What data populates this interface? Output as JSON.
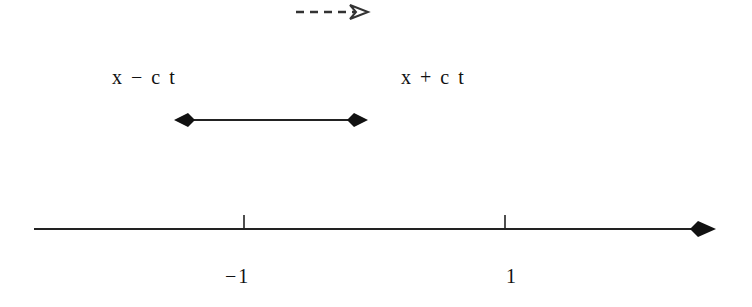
{
  "diagram": {
    "type": "number-line",
    "labels": {
      "left_endpoint": "x − c t",
      "right_endpoint": "x + c t",
      "tick_minus_one": "−1",
      "tick_one": "1"
    },
    "colors": {
      "line": "#1a1a1a",
      "background": "#ffffff"
    },
    "elements": {
      "direction_arrow": {
        "style": "dashed",
        "head": "open",
        "direction": "right"
      },
      "interval_arrow": {
        "style": "solid",
        "heads": "both",
        "head_shape": "filled-diamond"
      },
      "axis": {
        "direction": "right",
        "ticks": [
          -1,
          1
        ]
      }
    }
  }
}
